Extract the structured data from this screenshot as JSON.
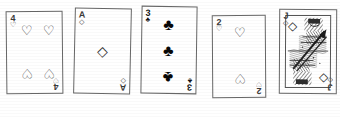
{
  "scene": {
    "title": "Five hand-drawn playing cards",
    "background_color": "#ffffff",
    "ink_color": "#2b2b2b",
    "card_count": 5
  },
  "suits": {
    "hearts_glyph": "♡",
    "hearts_solid": "♥",
    "diamonds_glyph": "◇",
    "diamonds_solid": "♦",
    "clubs_glyph": "♣",
    "spades_glyph": "♠"
  },
  "cards": [
    {
      "name": "four-of-hearts",
      "rank": "4",
      "suit": "hearts",
      "suit_glyph": "♡",
      "color": "#2e2e2e",
      "pip_count": 4,
      "is_face_card": false,
      "label": "4 of Hearts"
    },
    {
      "name": "ace-of-diamonds",
      "rank": "A",
      "suit": "diamonds",
      "suit_glyph": "◇",
      "color": "#2e2e2e",
      "pip_count": 1,
      "is_face_card": false,
      "label": "Ace of Diamonds"
    },
    {
      "name": "three-of-clubs",
      "rank": "3",
      "suit": "clubs",
      "suit_glyph": "♣",
      "color": "#080808",
      "pip_count": 3,
      "is_face_card": false,
      "label": "3 of Clubs"
    },
    {
      "name": "two-of-hearts",
      "rank": "2",
      "suit": "hearts",
      "suit_glyph": "♡",
      "color": "#2e2e2e",
      "pip_count": 2,
      "is_face_card": false,
      "label": "2 of Hearts"
    },
    {
      "name": "jack-of-diamonds",
      "rank": "J",
      "suit": "diamonds",
      "suit_glyph": "◇",
      "color": "#2a2a2a",
      "pip_count": 0,
      "is_face_card": true,
      "label": "Jack of Diamonds"
    }
  ]
}
